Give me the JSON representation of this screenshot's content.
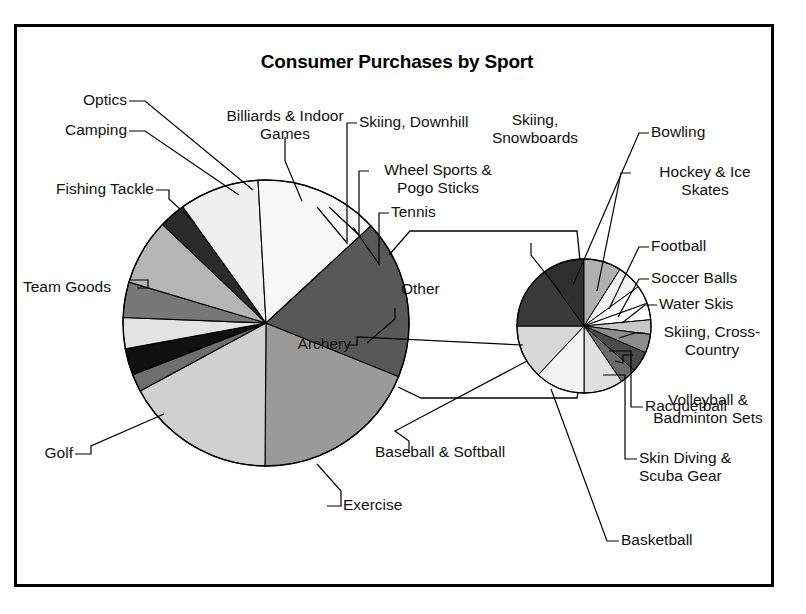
{
  "chart_data": {
    "type": "pie",
    "title": "Consumer Purchases by Sport",
    "subtype": "pie-of-pie",
    "xlabel": "",
    "ylabel": "",
    "grid": false,
    "legend": "none (leader-line data labels)",
    "primary_pie": {
      "name": "Main pie",
      "categories": [
        "Exercise",
        "Other",
        "Tennis",
        "Skiing, Downhill",
        "Wheel Sports & Pogo Sticks",
        "Billiards & Indoor Games",
        "Optics",
        "Camping",
        "Fishing Tackle",
        "Team Goods",
        "Golf"
      ],
      "values": [
        19.0,
        17.0,
        2.0,
        3.0,
        3.5,
        4.0,
        7.5,
        3.0,
        9.0,
        14.0,
        18.0
      ],
      "colors": [
        "#9a9a9a",
        "#d0d0d0",
        "#6e6e6e",
        "#101010",
        "#e3e3e3",
        "#777777",
        "#b5b5b5",
        "#2b2b2b",
        "#efefef",
        "#f7f7f7",
        "#585858"
      ]
    },
    "secondary_pie": {
      "name": "Other breakdown",
      "source_slice": "Other",
      "categories": [
        "Skiing, Snowboards",
        "Bowling",
        "Hockey & Ice Skates",
        "Football",
        "Soccer Balls",
        "Water Skis",
        "Skiing, Cross-Country",
        "Volleyball & Badminton Sets",
        "Racquetball",
        "Skin Diving & Scuba Gear",
        "Basketball",
        "Baseball & Softball",
        "Archery"
      ],
      "values": [
        10.0,
        9.0,
        6.0,
        4.5,
        4.0,
        3.5,
        4.5,
        5.0,
        4.0,
        9.5,
        12.0,
        13.0,
        15.0
      ],
      "colors": [
        "#2e2e2e",
        "#b0b0b0",
        "#f2f2f2",
        "#fbfbfb",
        "#ffffff",
        "#c8c8c8",
        "#8d8d8d",
        "#4a4a4a",
        "#6b6b6b",
        "#e0e0e0",
        "#f4f4f4",
        "#d8d8d8",
        "#3a3a3a"
      ]
    },
    "labels": {
      "optics": "Optics",
      "camping": "Camping",
      "fishing_tackle": "Fishing Tackle",
      "team_goods": "Team Goods",
      "golf": "Golf",
      "exercise": "Exercise",
      "billiards": "Billiards & Indoor\nGames",
      "skiing_downhill": "Skiing, Downhill",
      "wheel_sports": "Wheel Sports &\nPogo Sticks",
      "tennis": "Tennis",
      "other": "Other",
      "skiing_snowboards": "Skiing,\nSnowboards",
      "bowling": "Bowling",
      "hockey": "Hockey & Ice\nSkates",
      "football": "Football",
      "soccer_balls": "Soccer Balls",
      "water_skis": "Water Skis",
      "skiing_cross": "Skiing, Cross-\nCountry",
      "volleyball": "Volleyball &\nBadminton Sets",
      "racquetball": "Racquetball",
      "skin_diving": "Skin Diving &\nScuba Gear",
      "basketball": "Basketball",
      "baseball": "Baseball & Softball",
      "archery": "Archery"
    }
  }
}
